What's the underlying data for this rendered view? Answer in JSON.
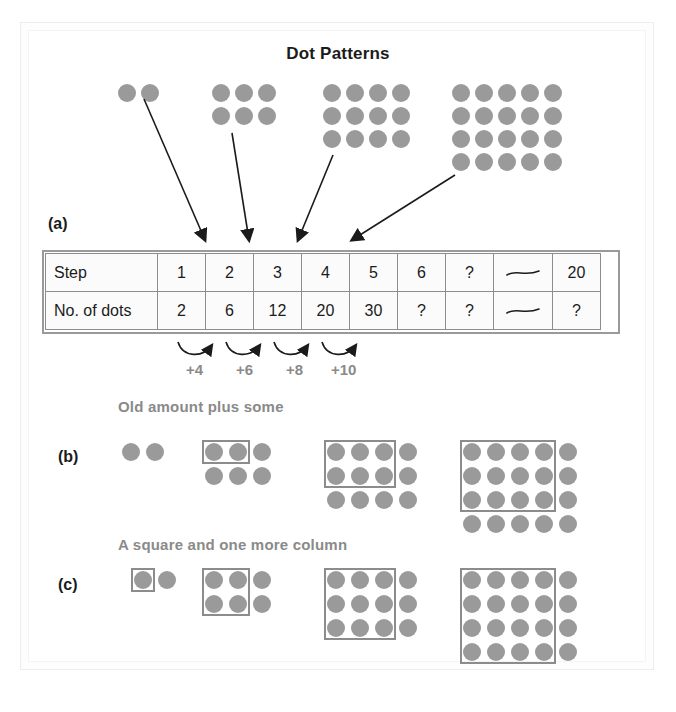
{
  "figure": {
    "title": "Dot Patterns",
    "colors": {
      "dot": "#9a9a9a",
      "box_outline": "#8c8c8c",
      "caption_text": "#8a8a8a",
      "table_border": "#8d8d8d",
      "text": "#1b1b1b"
    }
  },
  "parts": {
    "a": {
      "label": "(a)"
    },
    "b": {
      "label": "(b)",
      "caption": "Old amount plus some"
    },
    "c": {
      "label": "(c)",
      "caption": "A square and one more column"
    }
  },
  "top_patterns": [
    {
      "step": 1,
      "cols": 2,
      "rows": 1,
      "dots": 2
    },
    {
      "step": 2,
      "cols": 3,
      "rows": 2,
      "dots": 6
    },
    {
      "step": 3,
      "cols": 4,
      "rows": 3,
      "dots": 12
    },
    {
      "step": 4,
      "cols": 5,
      "rows": 4,
      "dots": 20
    }
  ],
  "table": {
    "row_labels": [
      "Step",
      "No. of dots"
    ],
    "steps": [
      "1",
      "2",
      "3",
      "4",
      "5",
      "6",
      "?",
      "—",
      "20"
    ],
    "num_dots": [
      "2",
      "6",
      "12",
      "20",
      "30",
      "?",
      "?",
      "—",
      "?"
    ],
    "wave_symbol": "squiggle-dash"
  },
  "differences": {
    "labels": [
      "+4",
      "+6",
      "+8",
      "+10"
    ],
    "note": "curved arrows between consecutive No. of dots cells"
  },
  "part_b_patterns": [
    {
      "step": 1,
      "cols": 2,
      "rows": 1,
      "box_cols": 0,
      "box_rows": 0
    },
    {
      "step": 2,
      "cols": 3,
      "rows": 2,
      "box_cols": 2,
      "box_rows": 1
    },
    {
      "step": 3,
      "cols": 4,
      "rows": 3,
      "box_cols": 3,
      "box_rows": 2
    },
    {
      "step": 4,
      "cols": 5,
      "rows": 4,
      "box_cols": 4,
      "box_rows": 3
    }
  ],
  "part_c_patterns": [
    {
      "step": 1,
      "cols": 2,
      "rows": 1,
      "box_cols": 1,
      "box_rows": 1
    },
    {
      "step": 2,
      "cols": 3,
      "rows": 2,
      "box_cols": 2,
      "box_rows": 2
    },
    {
      "step": 3,
      "cols": 4,
      "rows": 3,
      "box_cols": 3,
      "box_rows": 3
    },
    {
      "step": 4,
      "cols": 5,
      "rows": 4,
      "box_cols": 4,
      "box_rows": 4
    }
  ],
  "arrows": {
    "count": 4,
    "note": "arrows from each top dot pattern down to its Step column in the table"
  },
  "chart_data": {
    "type": "table",
    "title": "Dot Patterns",
    "categories": [
      "1",
      "2",
      "3",
      "4",
      "5",
      "6",
      "?",
      "—",
      "20"
    ],
    "series": [
      {
        "name": "Step",
        "values": [
          "1",
          "2",
          "3",
          "4",
          "5",
          "6",
          "?",
          "—",
          "20"
        ]
      },
      {
        "name": "No. of dots",
        "values": [
          "2",
          "6",
          "12",
          "20",
          "30",
          "?",
          "?",
          "—",
          "?"
        ]
      }
    ],
    "annotations": [
      "+4",
      "+6",
      "+8",
      "+10"
    ],
    "xlabel": "",
    "ylabel": ""
  }
}
